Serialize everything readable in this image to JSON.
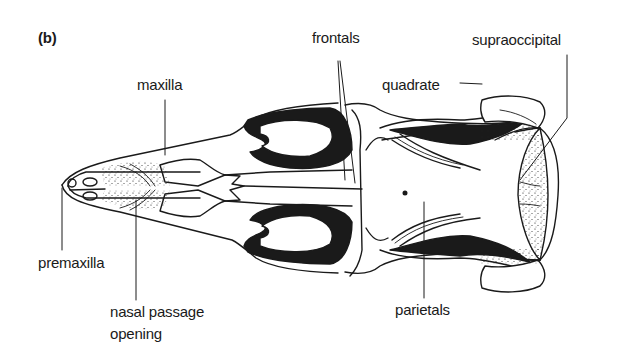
{
  "figure": {
    "panel_label": "(b)",
    "labels": {
      "maxilla": "maxilla",
      "frontals": "frontals",
      "supraoccipital": "supraoccipital",
      "quadrate": "quadrate",
      "premaxilla": "premaxilla",
      "nasal_line1": "nasal passage",
      "nasal_line2": "opening",
      "parietals": "parietals"
    },
    "colors": {
      "ink": "#1a1a1a",
      "background": "#ffffff"
    }
  }
}
